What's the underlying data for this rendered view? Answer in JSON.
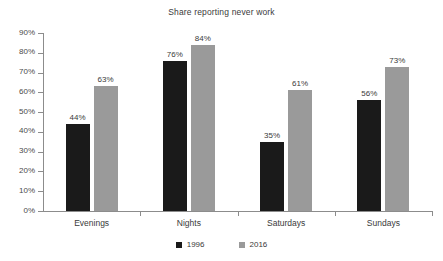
{
  "chart_data": {
    "type": "bar",
    "title": "Share reporting never work",
    "xlabel": "",
    "ylabel": "",
    "ylim": [
      0,
      90
    ],
    "grid": false,
    "legend_position": "bottom-center",
    "categories": [
      "Evenings",
      "Nights",
      "Saturdays",
      "Sundays"
    ],
    "ytick_labels": [
      "0%",
      "10%",
      "20%",
      "30%",
      "40%",
      "50%",
      "60%",
      "70%",
      "80%",
      "90%"
    ],
    "ytick_values": [
      0,
      10,
      20,
      30,
      40,
      50,
      60,
      70,
      80,
      90
    ],
    "series": [
      {
        "name": "1996",
        "color": "#1a1a1a",
        "values": [
          44,
          76,
          35,
          56
        ],
        "data_labels": [
          "44%",
          "76%",
          "35%",
          "56%"
        ]
      },
      {
        "name": "2016",
        "color": "#9a9a9a",
        "values": [
          63,
          84,
          61,
          73
        ],
        "data_labels": [
          "63%",
          "84%",
          "61%",
          "73%"
        ]
      }
    ]
  },
  "colors": {
    "series_1996": "#1a1a1a",
    "series_2016": "#9a9a9a",
    "axis": "#8c8c8c",
    "text": "#3a3a3a",
    "background": "#ffffff"
  }
}
